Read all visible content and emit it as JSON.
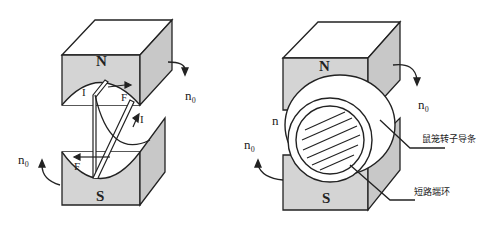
{
  "left_figure": {
    "north_label": "N",
    "south_label": "S",
    "rotation_label_right": "n₀",
    "rotation_label_left": "n₀",
    "current_label_top": "I",
    "current_label_right": "I",
    "force_label_top": "F",
    "force_label_bottom": "F"
  },
  "right_figure": {
    "north_label": "N",
    "south_label": "S",
    "rotation_label_right": "n₀",
    "rotation_label_left": "n₀",
    "rotor_speed_label": "n",
    "rotor_bar_label": "鼠笼转子导条",
    "end_ring_label": "短路端环"
  },
  "colors": {
    "magnet_face": "#d4d4d4",
    "magnet_top": "#ffffff",
    "stroke": "#222222"
  }
}
